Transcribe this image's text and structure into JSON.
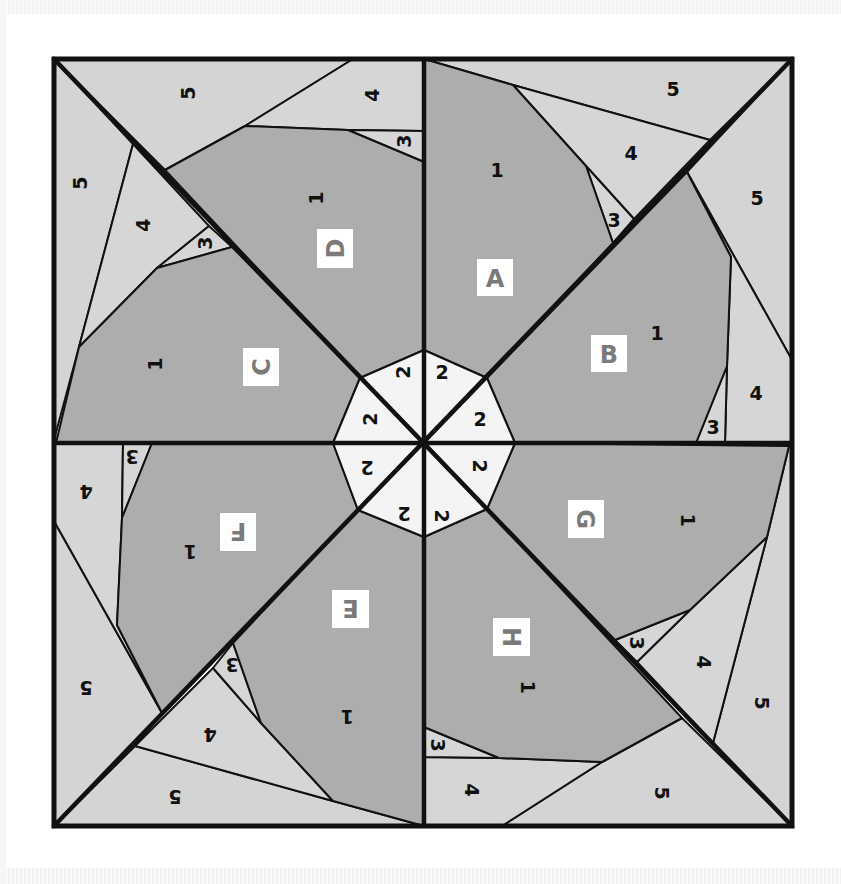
{
  "diagram": {
    "colors": {
      "background": "#ffffff",
      "piece_1": "#adadad",
      "piece_2": "#f4f4f4",
      "piece_3": "#d6d6d6",
      "piece_4": "#d6d6d6",
      "piece_5": "#d4d4d4",
      "stroke": "#111111",
      "label_box": "#ffffff",
      "label_text": "#7a7a7a"
    },
    "outer_square": {
      "x1": 54,
      "y1": 59,
      "x2": 792,
      "y2": 826
    },
    "center": {
      "x": 424,
      "y": 443
    },
    "sections": [
      {
        "id": "A",
        "label": "A",
        "label_box": {
          "x": 477,
          "y": 259,
          "w": 36,
          "h": 37,
          "rotate": 0
        },
        "pieces": [
          {
            "n": "5",
            "points": "424,59 710,59 792,59 710,140 513,85",
            "text": {
              "x": 673,
              "y": 89,
              "rotate": 0
            }
          },
          {
            "n": "4",
            "points": "513,85 710,140 634,219 586,166",
            "text": {
              "x": 631,
              "y": 153,
              "rotate": 0
            }
          },
          {
            "n": "3",
            "points": "586,166 634,219 613,243",
            "text": {
              "x": 614,
              "y": 220,
              "rotate": 0
            }
          },
          {
            "n": "1",
            "points": "424,59 513,85 586,166 613,243 487,378 424,350",
            "text": {
              "x": 497,
              "y": 170,
              "rotate": 0
            }
          },
          {
            "n": "2",
            "points": "424,350 487,378 424,443",
            "text": {
              "x": 442,
              "y": 372,
              "rotate": 0
            }
          }
        ]
      },
      {
        "id": "B",
        "label": "B",
        "label_box": {
          "x": 591,
          "y": 335,
          "w": 36,
          "h": 37,
          "rotate": 0
        },
        "pieces": [
          {
            "n": "5",
            "points": "792,59 792,360 687,172",
            "text": {
              "x": 757,
              "y": 198,
              "rotate": 0
            }
          },
          {
            "n": "4",
            "points": "687,172 792,360 792,443 725,443 727,366 731,257",
            "text": {
              "x": 756,
              "y": 393,
              "rotate": 0
            }
          },
          {
            "n": "3",
            "points": "727,366 725,443 696,443",
            "text": {
              "x": 713,
              "y": 427,
              "rotate": 0
            }
          },
          {
            "n": "1",
            "points": "687,172 731,257 727,366 696,443 515,443 487,378",
            "text": {
              "x": 657,
              "y": 333,
              "rotate": 0
            }
          },
          {
            "n": "2",
            "points": "487,378 515,443 424,443",
            "text": {
              "x": 480,
              "y": 419,
              "rotate": 0
            }
          }
        ]
      },
      {
        "id": "C",
        "label": "C",
        "label_box": {
          "x": 243,
          "y": 348,
          "w": 36,
          "h": 38,
          "rotate": -90
        },
        "pieces": [
          {
            "n": "5",
            "points": "54,59 133,144 79,347 54,440",
            "text": {
              "x": 80,
              "y": 183,
              "rotate": -90
            }
          },
          {
            "n": "4",
            "points": "133,144 209,226 157,268 79,347",
            "text": {
              "x": 143,
              "y": 225,
              "rotate": -90
            }
          },
          {
            "n": "3",
            "points": "209,226 232,247 157,268",
            "text": {
              "x": 205,
              "y": 243,
              "rotate": -90
            }
          },
          {
            "n": "1",
            "points": "232,247 360,378 333,443 56,443 79,347 157,268",
            "text": {
              "x": 155,
              "y": 364,
              "rotate": -90
            }
          },
          {
            "n": "2",
            "points": "360,378 424,443 333,443",
            "text": {
              "x": 370,
              "y": 419,
              "rotate": -90
            }
          }
        ]
      },
      {
        "id": "D",
        "label": "D",
        "label_box": {
          "x": 317,
          "y": 229,
          "w": 36,
          "h": 39,
          "rotate": -90
        },
        "pieces": [
          {
            "n": "5",
            "points": "54,59 353,59 245,126 165,170",
            "text": {
              "x": 188,
              "y": 93,
              "rotate": -90
            }
          },
          {
            "n": "4",
            "points": "353,59 424,59 424,131 348,130 245,126",
            "text": {
              "x": 372,
              "y": 95,
              "rotate": -90
            }
          },
          {
            "n": "3",
            "points": "348,130 424,131 424,162",
            "text": {
              "x": 404,
              "y": 141,
              "rotate": -90
            }
          },
          {
            "n": "1",
            "points": "165,170 245,126 348,130 424,162 424,350 360,378",
            "text": {
              "x": 316,
              "y": 198,
              "rotate": -90
            }
          },
          {
            "n": "2",
            "points": "424,350 424,443 360,378",
            "text": {
              "x": 403,
              "y": 372,
              "rotate": -90
            }
          }
        ]
      },
      {
        "id": "E",
        "label": "E",
        "label_box": {
          "x": 332,
          "y": 590,
          "w": 37,
          "h": 38,
          "rotate": 180
        },
        "pieces": [
          {
            "n": "5",
            "points": "54,826 135,746 333,801 424,826",
            "text": {
              "x": 175,
              "y": 797,
              "rotate": 180
            }
          },
          {
            "n": "4",
            "points": "135,746 213,668 261,723 333,801",
            "text": {
              "x": 210,
              "y": 735,
              "rotate": 180
            }
          },
          {
            "n": "3",
            "points": "213,668 233,643 261,723",
            "text": {
              "x": 232,
              "y": 665,
              "rotate": 180
            }
          },
          {
            "n": "1",
            "points": "233,643 358,510 424,537 424,826 333,801 261,723",
            "text": {
              "x": 347,
              "y": 717,
              "rotate": 180
            }
          },
          {
            "n": "2",
            "points": "358,510 424,443 424,537",
            "text": {
              "x": 404,
              "y": 514,
              "rotate": 180
            }
          }
        ]
      },
      {
        "id": "F",
        "label": "F",
        "label_box": {
          "x": 220,
          "y": 513,
          "w": 36,
          "h": 38,
          "rotate": 180
        },
        "pieces": [
          {
            "n": "5",
            "points": "54,521 162,713 135,746 54,826",
            "text": {
              "x": 86,
              "y": 688,
              "rotate": 180
            }
          },
          {
            "n": "4",
            "points": "54,443 123,443 122,518 117,625 162,713 54,521",
            "text": {
              "x": 86,
              "y": 492,
              "rotate": 180
            }
          },
          {
            "n": "3",
            "points": "123,443 152,443 122,518",
            "text": {
              "x": 132,
              "y": 457,
              "rotate": 180
            }
          },
          {
            "n": "1",
            "points": "152,443 333,443 358,510 162,713 117,625 122,518",
            "text": {
              "x": 190,
              "y": 552,
              "rotate": 180
            }
          },
          {
            "n": "2",
            "points": "333,443 424,443 358,510",
            "text": {
              "x": 367,
              "y": 468,
              "rotate": 180
            }
          }
        ]
      },
      {
        "id": "G",
        "label": "G",
        "label_box": {
          "x": 568,
          "y": 500,
          "w": 36,
          "h": 38,
          "rotate": 90
        },
        "pieces": [
          {
            "n": "5",
            "points": "792,443 792,826 713,743 767,537 789,446",
            "text": {
              "x": 762,
              "y": 703,
              "rotate": 90
            }
          },
          {
            "n": "4",
            "points": "767,537 713,743 637,662 690,610",
            "text": {
              "x": 704,
              "y": 662,
              "rotate": 90
            }
          },
          {
            "n": "3",
            "points": "690,610 637,662 615,640",
            "text": {
              "x": 637,
              "y": 643,
              "rotate": 90
            }
          },
          {
            "n": "1",
            "points": "515,443 789,446 767,537 690,610 615,640 487,509",
            "text": {
              "x": 688,
              "y": 520,
              "rotate": 90
            }
          },
          {
            "n": "2",
            "points": "424,443 515,443 487,509",
            "text": {
              "x": 480,
              "y": 466,
              "rotate": 90
            }
          }
        ]
      },
      {
        "id": "H",
        "label": "H",
        "label_box": {
          "x": 493,
          "y": 618,
          "w": 37,
          "h": 38,
          "rotate": 90
        },
        "pieces": [
          {
            "n": "5",
            "points": "792,826 502,826 602,762 682,718",
            "text": {
              "x": 662,
              "y": 793,
              "rotate": 90
            }
          },
          {
            "n": "4",
            "points": "424,757 499,758 602,762 502,826 424,826",
            "text": {
              "x": 472,
              "y": 790,
              "rotate": 90
            }
          },
          {
            "n": "3",
            "points": "424,727 499,758 424,757",
            "text": {
              "x": 438,
              "y": 745,
              "rotate": 90
            }
          },
          {
            "n": "1",
            "points": "424,537 487,509 682,718 602,762 499,758 424,727",
            "text": {
              "x": 528,
              "y": 687,
              "rotate": 90
            }
          },
          {
            "n": "2",
            "points": "424,443 487,509 424,537",
            "text": {
              "x": 442,
              "y": 516,
              "rotate": 90
            }
          }
        ]
      }
    ],
    "heavy_lines": [
      {
        "x1": 54,
        "y1": 59,
        "x2": 792,
        "y2": 826
      },
      {
        "x1": 792,
        "y1": 59,
        "x2": 54,
        "y2": 826
      },
      {
        "x1": 424,
        "y1": 59,
        "x2": 424,
        "y2": 826
      },
      {
        "x1": 54,
        "y1": 443,
        "x2": 792,
        "y2": 443
      }
    ]
  }
}
